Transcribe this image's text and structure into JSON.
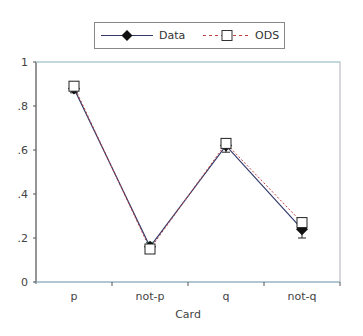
{
  "chart_data": {
    "type": "line",
    "title": "",
    "xlabel": "Card",
    "ylabel": "",
    "categories": [
      "p",
      "not-p",
      "q",
      "not-q"
    ],
    "series": [
      {
        "name": "Data",
        "values": [
          0.88,
          0.16,
          0.62,
          0.24
        ],
        "marker": "diamond-filled",
        "line": "solid",
        "color": "#333a6a",
        "error": [
          0.02,
          0.02,
          0.03,
          0.04
        ]
      },
      {
        "name": "ODS",
        "values": [
          0.89,
          0.15,
          0.63,
          0.27
        ],
        "marker": "square-open",
        "line": "dashed",
        "color": "#c04040"
      }
    ],
    "yticks": [
      "0",
      ".2",
      ".4",
      ".6",
      ".8",
      "1"
    ],
    "ylim": [
      0,
      1
    ],
    "grid": false,
    "legend_position": "top"
  },
  "legend": {
    "data_label": "Data",
    "ods_label": "ODS"
  }
}
